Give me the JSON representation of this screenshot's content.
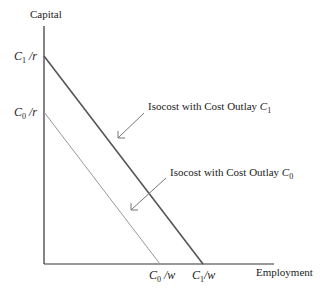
{
  "diagram": {
    "y_axis_label": "Capital",
    "x_axis_label": "Employment",
    "y_intercepts": [
      {
        "var": "C",
        "sub": "1",
        "den": "/r"
      },
      {
        "var": "C",
        "sub": "0",
        "den": "/r"
      }
    ],
    "x_intercepts": [
      {
        "var": "C",
        "sub": "0",
        "den": "/w"
      },
      {
        "var": "C",
        "sub": "1",
        "den": "/w"
      }
    ],
    "annotations": [
      {
        "text": "Isocost with Cost Outlay ",
        "var": "C",
        "sub": "1"
      },
      {
        "text": "Isocost with Cost Outlay ",
        "var": "C",
        "sub": "0"
      }
    ],
    "lines": [
      {
        "name": "isocost-C1",
        "from": [
          44,
          56
        ],
        "to": [
          203,
          263
        ],
        "color": "#555555"
      },
      {
        "name": "isocost-C0",
        "from": [
          44,
          112
        ],
        "to": [
          160,
          263
        ],
        "color": "#888888"
      }
    ]
  }
}
